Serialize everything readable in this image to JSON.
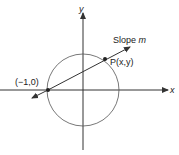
{
  "diagram": {
    "axes": {
      "x_label": "x",
      "y_label": "y"
    },
    "labels": {
      "slope": "Slope ",
      "slope_var": "m",
      "point_p": "P(x,y)",
      "point_start": "(−1,0)"
    },
    "colors": {
      "stroke": "#333333",
      "background": "#ffffff"
    }
  }
}
